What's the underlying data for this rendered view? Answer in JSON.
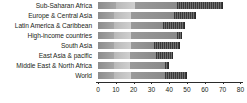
{
  "chart_data": {
    "type": "bar",
    "orientation": "horizontal",
    "stacked": true,
    "title": "",
    "subtitle": "",
    "xlabel": "",
    "ylabel": "",
    "xlim": [
      0,
      80
    ],
    "xticks": [
      0,
      10,
      20,
      30,
      40,
      50,
      60,
      70,
      80
    ],
    "xtick_labels": [
      "0",
      "10",
      "20",
      "30",
      "40",
      "50",
      "60",
      "70",
      "80"
    ],
    "grid": false,
    "legend": "none",
    "categories": [
      "Sub-Saharan Africa",
      "Europe & Central Asia",
      "Latin America & Caribbean",
      "High-income countries",
      "South Asia",
      "East Asia & pacific",
      "Middle East & North Africa",
      "World"
    ],
    "values": [
      70,
      55,
      49,
      47,
      46,
      42,
      40,
      50
    ],
    "series": [
      {
        "name": "segment-1",
        "values": [
          10,
          9,
          9,
          9,
          9,
          9,
          9,
          9
        ]
      },
      {
        "name": "segment-2",
        "values": [
          11,
          10,
          10,
          10,
          10,
          9,
          9,
          10
        ]
      },
      {
        "name": "segment-3",
        "values": [
          24,
          24,
          18,
          26,
          13,
          15,
          20,
          19
        ]
      },
      {
        "name": "segment-4",
        "values": [
          25,
          12,
          12,
          2,
          14,
          9,
          2,
          12
        ]
      }
    ],
    "bar_color_light": "#c9c9c9",
    "bar_color_mid": "#9a9a9a",
    "bar_color_dark": "#4a4a4a",
    "axis_color": "#2b2b2b",
    "text_color": "#231f20",
    "background": "#ffffff"
  }
}
